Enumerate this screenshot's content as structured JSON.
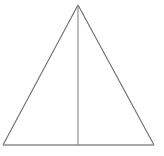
{
  "figure": {
    "type": "geometric-diagram",
    "background_color": "#ffffff",
    "canvas": {
      "width": 164,
      "height": 156
    },
    "stroke": {
      "color": "#6b6b6b",
      "width": 1.1,
      "median_color": "#8a8a8a",
      "median_width": 1.1,
      "base_color": "#8d8d8d",
      "base_width": 1.3
    },
    "vertices": {
      "apex": {
        "label": "apex",
        "x": 78,
        "y": 5
      },
      "bottom_left": {
        "label": "bottom-left",
        "x": 3,
        "y": 145
      },
      "bottom_right": {
        "label": "bottom-right",
        "x": 154,
        "y": 145
      },
      "base_midpoint": {
        "label": "base-midpoint",
        "x": 78,
        "y": 145
      }
    },
    "edges": [
      {
        "name": "left-side",
        "from": "apex",
        "to": "bottom_left",
        "points": "78,5 3,145"
      },
      {
        "name": "right-side",
        "from": "apex",
        "to": "bottom_right",
        "points": "78,5 154,145"
      },
      {
        "name": "base",
        "from": "bottom_left",
        "to": "bottom_right",
        "points": "3,145 154,145"
      },
      {
        "name": "median",
        "from": "apex",
        "to": "base_midpoint",
        "points": "78,5 78,145"
      }
    ]
  }
}
